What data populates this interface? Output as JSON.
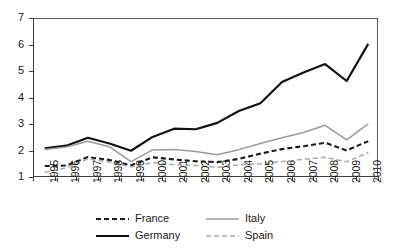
{
  "chart_data": {
    "type": "line",
    "title": "",
    "subtitle": "",
    "xlabel": "",
    "ylabel": "",
    "categories": [
      "1995",
      "1996",
      "1997",
      "1998",
      "1999",
      "2000",
      "2001",
      "2002",
      "2003",
      "2004",
      "2005",
      "2006",
      "2007",
      "2008",
      "2009",
      "2010"
    ],
    "x": [
      1995,
      1996,
      1997,
      1998,
      1999,
      2000,
      2001,
      2002,
      2003,
      2004,
      2005,
      2006,
      2007,
      2008,
      2009,
      2010
    ],
    "ylim": [
      1,
      7
    ],
    "yticks": [
      1,
      2,
      3,
      4,
      5,
      6,
      7
    ],
    "ytick_labels": [
      "1",
      "2",
      "3",
      "4",
      "5",
      "6",
      "7"
    ],
    "grid": false,
    "legend_position": "bottom",
    "series": [
      {
        "name": "France",
        "color": "#1a1a1a",
        "style": "dashed",
        "width": 2.1,
        "dash": "5,3",
        "values": [
          1.45,
          1.47,
          1.79,
          1.68,
          1.48,
          1.78,
          1.7,
          1.63,
          1.6,
          1.72,
          1.92,
          2.09,
          2.2,
          2.33,
          2.04,
          2.39
        ]
      },
      {
        "name": "Germany",
        "color": "#111111",
        "style": "solid",
        "width": 2.2,
        "dash": "",
        "values": [
          2.12,
          2.22,
          2.52,
          2.3,
          2.03,
          2.55,
          2.86,
          2.84,
          3.08,
          3.53,
          3.82,
          4.62,
          4.98,
          5.3,
          4.66,
          6.06
        ]
      },
      {
        "name": "Italy",
        "color": "#9a9a9a",
        "style": "solid",
        "width": 1.5,
        "dash": "",
        "values": [
          2.08,
          2.17,
          2.39,
          2.18,
          1.62,
          2.06,
          2.08,
          2.0,
          1.88,
          2.07,
          2.3,
          2.52,
          2.72,
          2.99,
          2.44,
          3.04
        ]
      },
      {
        "name": "Spain",
        "color": "#a8a8a8",
        "style": "dashed",
        "width": 1.5,
        "dash": "5,3",
        "values": [
          1.22,
          1.38,
          1.72,
          1.6,
          1.42,
          1.58,
          1.5,
          1.47,
          1.41,
          1.49,
          1.54,
          1.62,
          1.7,
          1.78,
          1.61,
          1.96
        ]
      }
    ]
  },
  "legend": {
    "entries": [
      {
        "label": "France"
      },
      {
        "label": "Italy"
      },
      {
        "label": "Germany"
      },
      {
        "label": "Spain"
      }
    ]
  }
}
